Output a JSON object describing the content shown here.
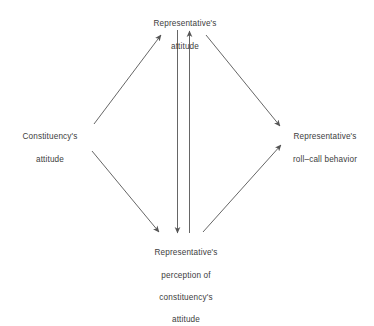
{
  "diagram": {
    "background_color": "#ffffff",
    "line_color": "#555555",
    "text_color": "#3d3d3d",
    "nodes": [
      {
        "id": "top",
        "name": "representatives-attitude",
        "lines": [
          "Representative's",
          "attitude"
        ],
        "text": "Representative's\nattitude"
      },
      {
        "id": "left",
        "name": "constituencys-attitude",
        "lines": [
          "Constituency's",
          "attitude"
        ],
        "text": "Constituency's\nattitude"
      },
      {
        "id": "right",
        "name": "representatives-roll-call-behavior",
        "lines": [
          "Representative's",
          "roll–call behavior"
        ],
        "text": "Representative's\nroll–call behavior"
      },
      {
        "id": "bottom",
        "name": "representatives-perception-of-constituencys-attitude",
        "lines": [
          "Representative's",
          "perception of",
          "constituency's",
          "attitude"
        ],
        "text": "Representative's\nperception of\nconstituency's\nattitude"
      }
    ],
    "edges": [
      {
        "id": "left-to-top",
        "from": "left",
        "to": "top",
        "arrow": "single",
        "direction": "up-right"
      },
      {
        "id": "left-to-bottom",
        "from": "left",
        "to": "bottom",
        "arrow": "single",
        "direction": "down-right"
      },
      {
        "id": "top-to-right",
        "from": "top",
        "to": "right",
        "arrow": "single",
        "direction": "down-right"
      },
      {
        "id": "bottom-to-right",
        "from": "bottom",
        "to": "right",
        "arrow": "single",
        "direction": "up-right"
      },
      {
        "id": "top-to-bottom",
        "from": "top",
        "to": "bottom",
        "arrow": "single",
        "direction": "down"
      },
      {
        "id": "bottom-to-top",
        "from": "bottom",
        "to": "top",
        "arrow": "single",
        "direction": "up"
      }
    ]
  }
}
